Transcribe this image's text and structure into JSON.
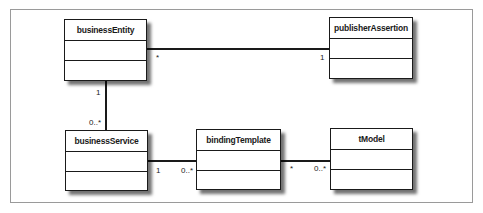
{
  "diagram": {
    "type": "uml-class-diagram",
    "classes": [
      {
        "id": "businessEntity",
        "name": "businessEntity"
      },
      {
        "id": "publisherAssertion",
        "name": "publisherAssertion"
      },
      {
        "id": "businessService",
        "name": "businessService"
      },
      {
        "id": "bindingTemplate",
        "name": "bindingTemplate"
      },
      {
        "id": "tModel",
        "name": "tModel"
      }
    ],
    "associations": [
      {
        "from": "businessEntity",
        "to": "publisherAssertion",
        "from_mult": "*",
        "to_mult": "1"
      },
      {
        "from": "businessEntity",
        "to": "businessService",
        "from_mult": "1",
        "to_mult": "0..*"
      },
      {
        "from": "businessService",
        "to": "bindingTemplate",
        "from_mult": "1",
        "to_mult": "0..*"
      },
      {
        "from": "bindingTemplate",
        "to": "tModel",
        "from_mult": "*",
        "to_mult": "0..*"
      }
    ]
  }
}
